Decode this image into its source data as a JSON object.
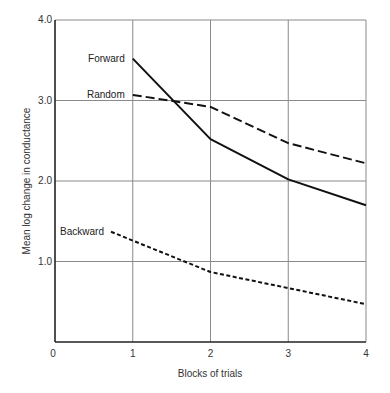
{
  "chart_data": {
    "type": "line",
    "title": "",
    "xlabel": "Blocks of trials",
    "ylabel": "Mean log change in conductance",
    "xlim": [
      0,
      4
    ],
    "ylim": [
      0,
      4.0
    ],
    "x_ticks": [
      "0",
      "1",
      "2",
      "3",
      "4"
    ],
    "y_ticks": [
      "1.0",
      "2.0",
      "3.0",
      "4.0"
    ],
    "grid": true,
    "legend_position": "inline labels at left end of each line",
    "series": [
      {
        "name": "Forward",
        "style": "solid",
        "x": [
          1,
          2,
          3,
          4
        ],
        "values": [
          3.52,
          2.52,
          2.02,
          1.7
        ]
      },
      {
        "name": "Random",
        "style": "dashed",
        "x": [
          1,
          2,
          3,
          4
        ],
        "values": [
          3.07,
          2.92,
          2.47,
          2.22
        ]
      },
      {
        "name": "Backward",
        "style": "dotted",
        "x": [
          0.72,
          1,
          2,
          3,
          4
        ],
        "values": [
          1.37,
          1.26,
          0.87,
          0.67,
          0.47
        ]
      }
    ]
  },
  "plot": {
    "left": 55,
    "right": 366,
    "top": 20,
    "bottom": 342,
    "line_color": "#111111",
    "grid_color": "#8a8a8a"
  }
}
